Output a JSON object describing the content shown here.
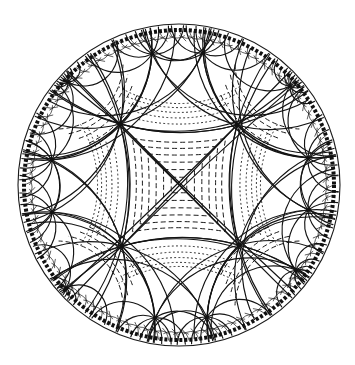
{
  "figure": {
    "kind": "hyperbolic-tiling",
    "model": "poincare-disk",
    "width": 355,
    "height": 365,
    "disk": {
      "cx": 179,
      "cy": 185,
      "r": 160
    },
    "colors": {
      "background": "#ffffff",
      "line": "#141414"
    },
    "central_vertices": [
      {
        "x": 120,
        "y": 124
      },
      {
        "x": 237,
        "y": 125
      },
      {
        "x": 239,
        "y": 245
      },
      {
        "x": 122,
        "y": 246
      }
    ],
    "outer_vertices": [
      {
        "x": 152,
        "y": 54
      },
      {
        "x": 203,
        "y": 53
      },
      {
        "x": 308,
        "y": 158
      },
      {
        "x": 308,
        "y": 210
      },
      {
        "x": 207,
        "y": 317
      },
      {
        "x": 155,
        "y": 318
      },
      {
        "x": 52,
        "y": 212
      },
      {
        "x": 52,
        "y": 160
      },
      {
        "x": 68,
        "y": 82
      },
      {
        "x": 290,
        "y": 86
      },
      {
        "x": 296,
        "y": 270
      },
      {
        "x": 66,
        "y": 288
      }
    ],
    "spokes_per_vertex": 12,
    "hatching": {
      "center": "dashed",
      "edge_regions": "dotted"
    }
  }
}
